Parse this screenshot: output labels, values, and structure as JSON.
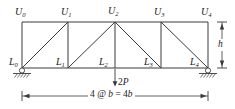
{
  "figure": {
    "type": "truss-diagram",
    "stroke_color": "#3a3a3a",
    "text_color": "#1a1a1a",
    "background": "#ffffff"
  },
  "top_chord": {
    "joints": [
      {
        "id": "U0",
        "letter": "U",
        "sub": "0",
        "x": 22,
        "y": 22
      },
      {
        "id": "U1",
        "letter": "U",
        "sub": "1",
        "x": 68,
        "y": 22
      },
      {
        "id": "U2",
        "letter": "U",
        "sub": "2",
        "x": 115,
        "y": 22
      },
      {
        "id": "U3",
        "letter": "U",
        "sub": "3",
        "x": 161,
        "y": 22
      },
      {
        "id": "U4",
        "letter": "U",
        "sub": "4",
        "x": 208,
        "y": 22
      }
    ]
  },
  "bottom_chord": {
    "joints": [
      {
        "id": "L0",
        "letter": "L",
        "sub": "0",
        "x": 22,
        "y": 68
      },
      {
        "id": "L1",
        "letter": "L",
        "sub": "1",
        "x": 68,
        "y": 68
      },
      {
        "id": "L2",
        "letter": "L",
        "sub": "2",
        "x": 115,
        "y": 68
      },
      {
        "id": "L3",
        "letter": "L",
        "sub": "3",
        "x": 161,
        "y": 68
      },
      {
        "id": "L4",
        "letter": "L",
        "sub": "4",
        "x": 208,
        "y": 68
      }
    ]
  },
  "members": {
    "verticals": [
      {
        "from": "U0",
        "to": "L0"
      },
      {
        "from": "U1",
        "to": "L1"
      },
      {
        "from": "U2",
        "to": "L2"
      },
      {
        "from": "U3",
        "to": "L3"
      },
      {
        "from": "U4",
        "to": "L4"
      }
    ],
    "diagonals": [
      {
        "from": "L0",
        "to": "U1"
      },
      {
        "from": "L1",
        "to": "U2"
      },
      {
        "from": "U2",
        "to": "L3"
      },
      {
        "from": "U3",
        "to": "L4"
      }
    ]
  },
  "supports": {
    "left": {
      "joint": "L0",
      "kind": "pin",
      "x": 22,
      "y": 68
    },
    "right": {
      "joint": "L4",
      "kind": "roller",
      "x": 208,
      "y": 68
    }
  },
  "load": {
    "label": "2P",
    "magnitude": "2",
    "symbol": "P",
    "at_joint": "L2",
    "direction": "down",
    "x": 115,
    "arrow_top": 70,
    "arrow_bottom": 86
  },
  "dimensions": {
    "span": {
      "label": "4 @ b = 4b",
      "prefix": "4 @ ",
      "var1": "b",
      "middle": " = 4",
      "var2": "b",
      "y": 96,
      "x_start": 22,
      "x_end": 208
    },
    "height": {
      "label": "h",
      "x": 222,
      "y_top": 22,
      "y_bottom": 68
    }
  }
}
